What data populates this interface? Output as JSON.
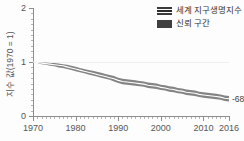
{
  "chart_data": {
    "type": "line",
    "title": "",
    "subtitle": "",
    "xlabel": "",
    "ylabel": "지수 값(1970 = 1)",
    "xlim": [
      1970,
      2016
    ],
    "ylim": [
      0,
      2
    ],
    "grid": true,
    "gridlines_y": [
      1
    ],
    "legend_position": "top-right",
    "y_ticks": [
      0,
      1,
      2
    ],
    "y_tick_labels": [
      "0",
      "1",
      "2"
    ],
    "x_ticks": [
      1970,
      1980,
      1990,
      2000,
      2010,
      2016
    ],
    "x_tick_labels": [
      "1970",
      "1980",
      "1990",
      "2000",
      "2010",
      "2016"
    ],
    "x_minor_tick_interval": 1,
    "y_minor_tick_interval": 0.1,
    "annotations": [
      {
        "text": "-68%",
        "x": 2016,
        "y": 0.32
      }
    ],
    "legend": [
      {
        "label": "세계 지구생명지수",
        "style": "line-with-band",
        "color": "#2b2b2b"
      },
      {
        "label": "신뢰 구간",
        "style": "solid",
        "color": "#3f3f3f"
      }
    ],
    "x": [
      1970,
      1971,
      1972,
      1973,
      1974,
      1975,
      1976,
      1977,
      1978,
      1979,
      1980,
      1981,
      1982,
      1983,
      1984,
      1985,
      1986,
      1987,
      1988,
      1989,
      1990,
      1991,
      1992,
      1993,
      1994,
      1995,
      1996,
      1997,
      1998,
      1999,
      2000,
      2001,
      2002,
      2003,
      2004,
      2005,
      2006,
      2007,
      2008,
      2009,
      2010,
      2011,
      2012,
      2013,
      2014,
      2015,
      2016
    ],
    "series": [
      {
        "name": "세계 지구생명지수",
        "values": [
          1.0,
          0.99,
          0.98,
          0.97,
          0.96,
          0.95,
          0.94,
          0.93,
          0.91,
          0.89,
          0.87,
          0.85,
          0.83,
          0.81,
          0.79,
          0.77,
          0.75,
          0.73,
          0.71,
          0.69,
          0.66,
          0.64,
          0.63,
          0.62,
          0.61,
          0.6,
          0.59,
          0.57,
          0.56,
          0.55,
          0.53,
          0.52,
          0.5,
          0.49,
          0.47,
          0.46,
          0.44,
          0.43,
          0.42,
          0.4,
          0.39,
          0.38,
          0.37,
          0.36,
          0.35,
          0.33,
          0.32
        ]
      },
      {
        "name": "신뢰 구간 상한",
        "values": [
          1.0,
          1.0,
          0.99,
          0.99,
          0.98,
          0.98,
          0.97,
          0.96,
          0.95,
          0.93,
          0.91,
          0.89,
          0.87,
          0.85,
          0.84,
          0.82,
          0.8,
          0.78,
          0.76,
          0.74,
          0.71,
          0.69,
          0.68,
          0.67,
          0.66,
          0.65,
          0.64,
          0.62,
          0.61,
          0.6,
          0.58,
          0.57,
          0.55,
          0.54,
          0.52,
          0.51,
          0.49,
          0.48,
          0.47,
          0.45,
          0.44,
          0.43,
          0.42,
          0.41,
          0.4,
          0.38,
          0.37
        ]
      },
      {
        "name": "신뢰 구간 하한",
        "values": [
          1.0,
          0.98,
          0.96,
          0.95,
          0.93,
          0.92,
          0.9,
          0.89,
          0.87,
          0.85,
          0.83,
          0.81,
          0.79,
          0.77,
          0.75,
          0.73,
          0.71,
          0.69,
          0.67,
          0.64,
          0.61,
          0.59,
          0.58,
          0.57,
          0.56,
          0.55,
          0.54,
          0.52,
          0.51,
          0.5,
          0.48,
          0.47,
          0.45,
          0.44,
          0.42,
          0.41,
          0.39,
          0.38,
          0.37,
          0.35,
          0.34,
          0.33,
          0.32,
          0.31,
          0.3,
          0.28,
          0.27
        ]
      }
    ]
  },
  "colors": {
    "line": "#2b2b2b",
    "band": "#6e6e6e",
    "axis": "#8d8d8d",
    "tick_text": "#555555",
    "grid": "#efefef",
    "background": "#fdfdfd"
  }
}
